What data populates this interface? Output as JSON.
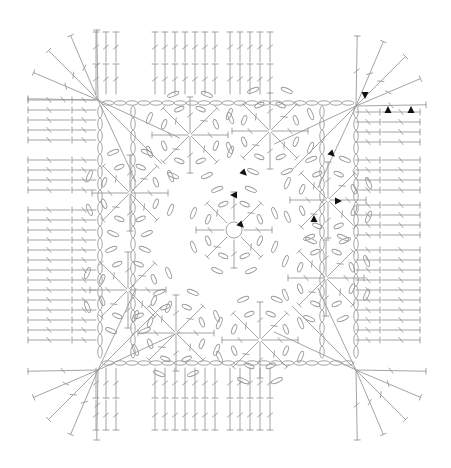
{
  "diagram": {
    "type": "crochet-chart",
    "title": "",
    "shape": "square motif with rounded corners",
    "colors": {
      "stitch_line": "#9a9a9a",
      "marker": "#111111",
      "background": "#ffffff"
    },
    "layout": {
      "center": [
        225,
        231
      ],
      "inner_square": {
        "x": 98,
        "y": 100,
        "w": 286,
        "h": 286
      },
      "outer_border": {
        "x": 26,
        "y": 26,
        "w": 402,
        "h": 408,
        "corner_radius": 55
      }
    },
    "medallions": [
      {
        "id": "center",
        "cx": 234,
        "cy": 230,
        "petals": 8,
        "has_ring": true
      },
      {
        "id": "top",
        "cx": 190,
        "cy": 135,
        "petals": 8
      },
      {
        "id": "right",
        "cx": 328,
        "cy": 200,
        "petals": 8
      },
      {
        "id": "bottom",
        "cx": 260,
        "cy": 340,
        "petals": 8
      },
      {
        "id": "left",
        "cx": 128,
        "cy": 290,
        "petals": 8
      },
      {
        "id": "upper-left",
        "cx": 130,
        "cy": 193,
        "petals": 8
      },
      {
        "id": "upper-right",
        "cx": 270,
        "cy": 131,
        "petals": 8
      },
      {
        "id": "lower-right",
        "cx": 326,
        "cy": 278,
        "petals": 8
      },
      {
        "id": "lower-left",
        "cx": 176,
        "cy": 333,
        "petals": 8
      }
    ],
    "corner_fans": [
      {
        "corner": "top-left",
        "cx": 98,
        "cy": 100
      },
      {
        "corner": "top-right",
        "cx": 356,
        "cy": 106
      },
      {
        "corner": "bottom-right",
        "cx": 356,
        "cy": 370
      },
      {
        "corner": "bottom-left",
        "cx": 98,
        "cy": 370
      }
    ],
    "border_rows": {
      "stitch": "double crochet",
      "rows_per_side": 2,
      "groups": {
        "top": [
          [
            96,
            125
          ],
          [
            155,
            185
          ],
          [
            195,
            215
          ],
          [
            230,
            270
          ]
        ],
        "bottom": [
          [
            96,
            125
          ],
          [
            155,
            185
          ],
          [
            195,
            215
          ],
          [
            230,
            270
          ]
        ],
        "left": [
          [
            100,
            148
          ],
          [
            160,
            195
          ],
          [
            210,
            240
          ],
          [
            250,
            345
          ]
        ],
        "right": [
          [
            112,
            148
          ],
          [
            160,
            195
          ],
          [
            205,
            240
          ],
          [
            250,
            345
          ]
        ]
      }
    },
    "markers": [
      {
        "x": 244,
        "y": 173,
        "dir": "down-right"
      },
      {
        "x": 234,
        "y": 195,
        "dir": "left"
      },
      {
        "x": 241,
        "y": 225,
        "dir": "down-right"
      },
      {
        "x": 332,
        "y": 154,
        "dir": "down-right"
      },
      {
        "x": 338,
        "y": 201,
        "dir": "right"
      },
      {
        "x": 314,
        "y": 219,
        "dir": "up"
      },
      {
        "x": 365,
        "y": 95,
        "dir": "down"
      },
      {
        "x": 388,
        "y": 110,
        "dir": "up"
      },
      {
        "x": 411,
        "y": 110,
        "dir": "up"
      }
    ]
  }
}
